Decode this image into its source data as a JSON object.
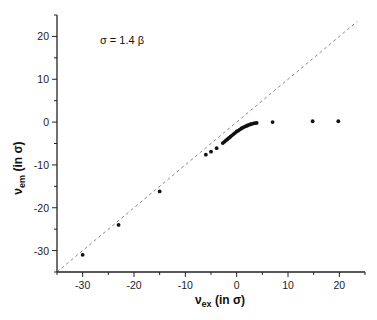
{
  "chart_data": {
    "type": "scatter",
    "title": "",
    "annotation": "σ = 1.4 β",
    "xlabel": {
      "main": "ν",
      "sub": "ex",
      "rest": " (in σ)"
    },
    "ylabel": {
      "main": "ν",
      "sub": "em",
      "rest": " (in σ)"
    },
    "xlim": [
      -35,
      25
    ],
    "ylim": [
      -35,
      25
    ],
    "xticks": [
      -30,
      -20,
      -10,
      0,
      10,
      20
    ],
    "yticks": [
      -30,
      -20,
      -10,
      0,
      10,
      20
    ],
    "minor_tick_step": 5,
    "grid": false,
    "legend": null,
    "reference_line": {
      "label": "y = x",
      "style": "dashed",
      "color": "#888888",
      "from": [
        -35,
        -35
      ],
      "to": [
        23.5,
        23.5
      ]
    },
    "series": [
      {
        "name": "data",
        "marker": "filled-circle",
        "color": "#111111",
        "points": [
          [
            -30,
            -31
          ],
          [
            -23,
            -24
          ],
          [
            -15,
            -16.2
          ],
          [
            -6,
            -7.6
          ],
          [
            -5,
            -6.9
          ],
          [
            -3.9,
            -6.1
          ],
          [
            -2.7,
            -4.9
          ],
          [
            -2.4,
            -4.6
          ],
          [
            -2.1,
            -4.3
          ],
          [
            -1.8,
            -4.0
          ],
          [
            -1.5,
            -3.7
          ],
          [
            -1.2,
            -3.4
          ],
          [
            -0.9,
            -3.1
          ],
          [
            -0.6,
            -2.8
          ],
          [
            -0.3,
            -2.5
          ],
          [
            0.0,
            -2.2
          ],
          [
            0.3,
            -2.0
          ],
          [
            0.6,
            -1.75
          ],
          [
            0.9,
            -1.5
          ],
          [
            1.2,
            -1.3
          ],
          [
            1.5,
            -1.1
          ],
          [
            1.8,
            -0.95
          ],
          [
            2.1,
            -0.8
          ],
          [
            2.4,
            -0.65
          ],
          [
            2.7,
            -0.5
          ],
          [
            3.0,
            -0.4
          ],
          [
            3.3,
            -0.3
          ],
          [
            3.6,
            -0.25
          ],
          [
            3.9,
            -0.2
          ],
          [
            7,
            0
          ],
          [
            14.8,
            0.2
          ],
          [
            19.8,
            0.2
          ]
        ]
      }
    ]
  },
  "tick_labels": {
    "x": [
      "-30",
      "-20",
      "-10",
      "0",
      "10",
      "20"
    ],
    "y": [
      "20",
      "10",
      "0",
      "-10",
      "-20",
      "-30"
    ]
  }
}
